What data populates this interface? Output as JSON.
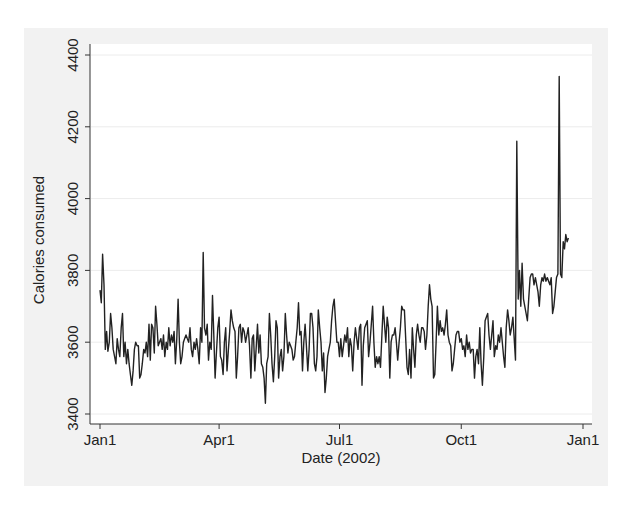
{
  "chart_data": {
    "type": "line",
    "title": "",
    "xlabel": "Date (2002)",
    "ylabel": "Calories consumed",
    "ylim": [
      3400,
      4400
    ],
    "xlim_days": [
      0,
      365
    ],
    "y_ticks": [
      3400,
      3600,
      3800,
      4000,
      4200,
      4400
    ],
    "y_tick_labels": [
      "3400",
      "3600",
      "3800",
      "4000",
      "4200",
      "4400"
    ],
    "x_ticks_days": [
      0,
      90,
      181,
      273,
      365
    ],
    "x_tick_labels": [
      "Jan1",
      "Apr1",
      "Jul1",
      "Oct1",
      "Jan1"
    ],
    "grid": "horizontal",
    "legend": "none",
    "line_color": "#222222",
    "series": [
      {
        "name": "Calories consumed",
        "x_days": [
          0,
          1,
          2,
          3,
          4,
          5,
          6,
          7,
          8,
          9,
          10,
          11,
          12,
          13,
          14,
          15,
          16,
          17,
          18,
          19,
          20,
          21,
          22,
          23,
          24,
          25,
          26,
          27,
          28,
          29,
          30,
          31,
          32,
          33,
          34,
          35,
          36,
          37,
          38,
          39,
          40,
          41,
          42,
          43,
          44,
          45,
          46,
          47,
          48,
          49,
          50,
          51,
          52,
          53,
          54,
          55,
          56,
          57,
          58,
          59,
          60,
          61,
          62,
          63,
          64,
          65,
          66,
          67,
          68,
          69,
          70,
          71,
          72,
          73,
          74,
          75,
          76,
          77,
          78,
          79,
          80,
          81,
          82,
          83,
          84,
          85,
          86,
          87,
          88,
          89,
          90,
          91,
          92,
          93,
          94,
          95,
          96,
          97,
          98,
          99,
          100,
          101,
          102,
          103,
          104,
          105,
          106,
          107,
          108,
          109,
          110,
          111,
          112,
          113,
          114,
          115,
          116,
          117,
          118,
          119,
          120,
          121,
          122,
          123,
          124,
          125,
          126,
          127,
          128,
          129,
          130,
          131,
          132,
          133,
          134,
          135,
          136,
          137,
          138,
          139,
          140,
          141,
          142,
          143,
          144,
          145,
          146,
          147,
          148,
          149,
          150,
          151,
          152,
          153,
          154,
          155,
          156,
          157,
          158,
          159,
          160,
          161,
          162,
          163,
          164,
          165,
          166,
          167,
          168,
          169,
          170,
          171,
          172,
          173,
          174,
          175,
          176,
          177,
          178,
          179,
          180,
          181,
          182,
          183,
          184,
          185,
          186,
          187,
          188,
          189,
          190,
          191,
          192,
          193,
          194,
          195,
          196,
          197,
          198,
          199,
          200,
          201,
          202,
          203,
          204,
          205,
          206,
          207,
          208,
          209,
          210,
          211,
          212,
          213,
          214,
          215,
          216,
          217,
          218,
          219,
          220,
          221,
          222,
          223,
          224,
          225,
          226,
          227,
          228,
          229,
          230,
          231,
          232,
          233,
          234,
          235,
          236,
          237,
          238,
          239,
          240,
          241,
          242,
          243,
          244,
          245,
          246,
          247,
          248,
          249,
          250,
          251,
          252,
          253,
          254,
          255,
          256,
          257,
          258,
          259,
          260,
          261,
          262,
          263,
          264,
          265,
          266,
          267,
          268,
          269,
          270,
          271,
          272,
          273,
          274,
          275,
          276,
          277,
          278,
          279,
          280,
          281,
          282,
          283,
          284,
          285,
          286,
          287,
          288,
          289,
          290,
          291,
          292,
          293,
          294,
          295,
          296,
          297,
          298,
          299,
          300,
          301,
          302,
          303,
          304,
          305,
          306,
          307,
          308,
          309,
          310,
          311,
          312,
          313,
          314,
          315,
          316,
          317,
          318,
          319,
          320,
          321,
          322,
          323,
          324,
          325,
          326,
          327,
          328,
          329,
          330,
          331,
          332,
          333,
          334,
          335,
          336,
          337,
          338,
          339,
          340,
          341,
          342,
          343,
          344,
          345,
          346,
          347,
          348,
          349,
          350,
          351,
          352,
          353,
          354,
          355,
          356,
          357,
          358,
          359,
          360,
          361,
          362,
          363,
          364
        ],
        "values": [
          3745,
          3710,
          3845,
          3760,
          3580,
          3630,
          3575,
          3600,
          3680,
          3640,
          3580,
          3560,
          3540,
          3610,
          3580,
          3560,
          3640,
          3680,
          3560,
          3600,
          3540,
          3580,
          3540,
          3510,
          3480,
          3520,
          3580,
          3600,
          3590,
          3590,
          3500,
          3510,
          3540,
          3580,
          3570,
          3600,
          3560,
          3650,
          3550,
          3650,
          3640,
          3570,
          3700,
          3650,
          3590,
          3600,
          3610,
          3580,
          3620,
          3560,
          3600,
          3580,
          3640,
          3590,
          3620,
          3600,
          3630,
          3540,
          3610,
          3720,
          3600,
          3540,
          3560,
          3600,
          3610,
          3620,
          3610,
          3600,
          3640,
          3580,
          3560,
          3600,
          3580,
          3610,
          3580,
          3540,
          3640,
          3600,
          3850,
          3640,
          3620,
          3650,
          3550,
          3600,
          3580,
          3730,
          3620,
          3500,
          3570,
          3640,
          3670,
          3560,
          3550,
          3510,
          3600,
          3640,
          3520,
          3580,
          3630,
          3690,
          3660,
          3640,
          3630,
          3500,
          3560,
          3640,
          3650,
          3600,
          3640,
          3630,
          3600,
          3620,
          3640,
          3590,
          3500,
          3610,
          3620,
          3520,
          3580,
          3650,
          3570,
          3620,
          3540,
          3530,
          3500,
          3430,
          3540,
          3560,
          3680,
          3620,
          3540,
          3490,
          3560,
          3660,
          3640,
          3500,
          3560,
          3580,
          3520,
          3560,
          3680,
          3620,
          3570,
          3600,
          3590,
          3580,
          3550,
          3560,
          3600,
          3640,
          3710,
          3620,
          3630,
          3520,
          3600,
          3650,
          3590,
          3520,
          3580,
          3680,
          3680,
          3640,
          3540,
          3520,
          3560,
          3690,
          3640,
          3600,
          3520,
          3570,
          3460,
          3500,
          3560,
          3580,
          3600,
          3660,
          3700,
          3720,
          3660,
          3600,
          3600,
          3560,
          3610,
          3560,
          3590,
          3620,
          3600,
          3640,
          3560,
          3610,
          3590,
          3520,
          3600,
          3640,
          3610,
          3580,
          3640,
          3650,
          3480,
          3590,
          3640,
          3650,
          3660,
          3560,
          3600,
          3650,
          3700,
          3600,
          3530,
          3560,
          3540,
          3560,
          3530,
          3620,
          3700,
          3650,
          3600,
          3670,
          3640,
          3500,
          3600,
          3620,
          3620,
          3640,
          3600,
          3550,
          3600,
          3640,
          3700,
          3690,
          3690,
          3610,
          3530,
          3510,
          3580,
          3500,
          3640,
          3580,
          3530,
          3620,
          3650,
          3620,
          3600,
          3640,
          3640,
          3630,
          3580,
          3620,
          3700,
          3760,
          3720,
          3700,
          3500,
          3510,
          3600,
          3700,
          3620,
          3660,
          3630,
          3640,
          3620,
          3650,
          3690,
          3620,
          3600,
          3590,
          3520,
          3540,
          3580,
          3620,
          3630,
          3630,
          3600,
          3610,
          3580,
          3590,
          3560,
          3620,
          3580,
          3600,
          3570,
          3580,
          3580,
          3500,
          3560,
          3580,
          3540,
          3640,
          3540,
          3480,
          3560,
          3660,
          3670,
          3680,
          3620,
          3580,
          3620,
          3660,
          3560,
          3590,
          3580,
          3620,
          3600,
          3640,
          3600,
          3560,
          3530,
          3640,
          3690,
          3660,
          3620,
          3640,
          3670,
          3610,
          3550,
          4160,
          3720,
          3800,
          3700,
          3820,
          3720,
          3700,
          3680,
          3660,
          3720,
          3780,
          3790,
          3790,
          3760,
          3780,
          3760,
          3740,
          3700,
          3760,
          3780,
          3770,
          3790,
          3770,
          3780,
          3770,
          3760,
          3780,
          3680,
          3700,
          3740,
          3780,
          3790,
          4340,
          3790,
          3780,
          3880,
          3860,
          3900,
          3880,
          3890
        ]
      }
    ]
  }
}
